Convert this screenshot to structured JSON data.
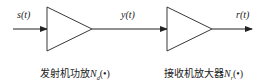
{
  "diagram": {
    "type": "block-diagram",
    "signals": {
      "input": "s(t)",
      "middle": "y(t)",
      "output": "r(t)"
    },
    "blocks": [
      {
        "shape": "amplifier-triangle",
        "caption": "发射机功放",
        "symbol": "N",
        "subscript": "d",
        "argument": "(•)"
      },
      {
        "shape": "amplifier-triangle",
        "caption": "接收机放大器",
        "symbol": "N",
        "subscript": "r",
        "argument": "(•)"
      }
    ],
    "colors": {
      "line": "#222222",
      "background": "#ffffff"
    }
  }
}
